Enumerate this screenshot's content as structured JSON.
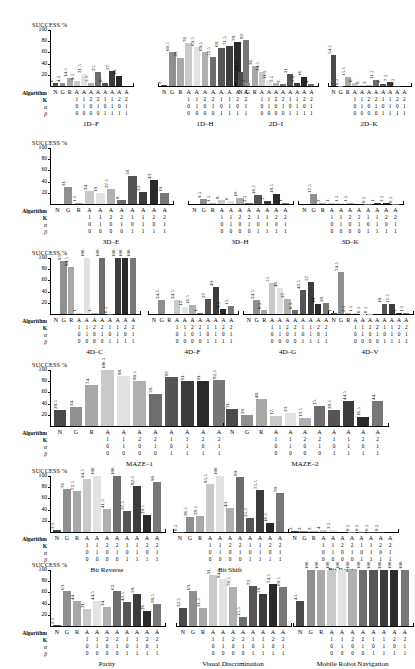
{
  "figure": {
    "y_axis_label": "SUCCESS %",
    "y_ticks": [
      "100",
      "80",
      "60",
      "40",
      "20"
    ],
    "y_max": 100,
    "param_row_labels": {
      "algorithm": "Algorithm",
      "k": "K",
      "alpha": "α",
      "beta": "β"
    },
    "algorithm_labels": [
      "N",
      "G",
      "R",
      "A",
      "A",
      "A",
      "A",
      "A",
      "A",
      "A",
      "A"
    ],
    "k_values": [
      "1",
      "1",
      "2",
      "2",
      "1",
      "1",
      "2",
      "2"
    ],
    "alpha_values": [
      "0",
      "1",
      "0",
      "1",
      "0",
      "1",
      "0",
      "1"
    ],
    "beta_values": [
      "0",
      "0",
      "0",
      "0",
      "1",
      "1",
      "1",
      "1"
    ],
    "bar_colors": [
      "#4a4a4a",
      "#8f8f8f",
      "#a8a8a8",
      "#c9c9c9",
      "#e2e2e2",
      "#b0b0b0",
      "#6e6e6e",
      "#555555",
      "#3c3c3c",
      "#2a2a2a",
      "#777777"
    ]
  },
  "chart_data": [
    {
      "type": "bar",
      "title": "1D–F",
      "ylabel": "SUCCESS %",
      "ylim": [
        0,
        100
      ],
      "categories": [
        "N",
        "G",
        "R",
        "A",
        "A",
        "A",
        "A",
        "A",
        "A",
        "A",
        "A"
      ],
      "values": [
        6,
        4.5,
        14.5,
        9.5,
        21.5,
        5.5,
        25,
        6,
        27,
        18,
        0
      ],
      "labels": [
        "6.",
        "4.5",
        "14.5",
        "9.5",
        "21.5",
        "5.5",
        "25.",
        "6.",
        "27.",
        "18.",
        ""
      ]
    },
    {
      "type": "bar",
      "title": "1D–H",
      "ylabel": "SUCCESS %",
      "ylim": [
        0,
        100
      ],
      "categories": [
        "N",
        "G",
        "R",
        "A",
        "A",
        "A",
        "A",
        "A",
        "A",
        "A",
        "A"
      ],
      "values": [
        2,
        60.5,
        50,
        76,
        69.5,
        60.5,
        52.5,
        68,
        71.5,
        78,
        82
      ],
      "labels": [
        "2.",
        "60.5",
        "50.",
        "76.",
        "69.5",
        "69.5",
        "52.5",
        "68.",
        "71.5",
        "78.",
        "82."
      ]
    },
    {
      "type": "bar",
      "title": "2D–I",
      "ylabel": "SUCCESS %",
      "ylim": [
        0,
        100
      ],
      "categories": [
        "N",
        "G",
        "R",
        "A",
        "A",
        "A",
        "A",
        "A",
        "A",
        "A",
        "A"
      ],
      "values": [
        24.5,
        5,
        36,
        24.5,
        11.5,
        5.5,
        3,
        21,
        5.5,
        16,
        4
      ],
      "labels": [
        "24.5",
        "5.",
        "36.",
        "24.5",
        "11.5",
        "5.5",
        "3.",
        "21.",
        "5.5",
        "16.",
        "4."
      ]
    },
    {
      "type": "bar",
      "title": "2D–K",
      "ylabel": "SUCCESS %",
      "ylim": [
        0,
        100
      ],
      "categories": [
        "N",
        "G",
        "R",
        "A",
        "A",
        "A",
        "A",
        "A",
        "A",
        "A",
        "A"
      ],
      "values": [
        54.5,
        0.5,
        15.5,
        6,
        2,
        2,
        11.5,
        3,
        7.5,
        0.5,
        0
      ],
      "labels": [
        "54.5",
        "0.5",
        "15.5",
        "6.",
        "2.",
        "2.",
        "11.5",
        "3.",
        "7.5",
        "0.5",
        ""
      ]
    },
    {
      "type": "bar",
      "title": "3D–E",
      "ylabel": "SUCCESS %",
      "ylim": [
        0,
        100
      ],
      "categories": [
        "N",
        "G",
        "R",
        "A",
        "A",
        "A",
        "A",
        "A",
        "A",
        "A",
        "A"
      ],
      "values": [
        0,
        31,
        1.5,
        24,
        19,
        27.5,
        8,
        50,
        22,
        43,
        19
      ],
      "labels": [
        "",
        "31.",
        "1.5",
        "24.",
        "19.",
        "27.5",
        "8.",
        "50.",
        "22.",
        "43.",
        "19."
      ]
    },
    {
      "type": "bar",
      "title": "3D–H",
      "ylabel": "SUCCESS %",
      "ylim": [
        0,
        100
      ],
      "categories": [
        "N",
        "G",
        "R",
        "A",
        "A",
        "A",
        "A",
        "A",
        "A",
        "A",
        "A"
      ],
      "values": [
        0,
        9.5,
        1.5,
        8,
        6,
        10,
        2.5,
        16.5,
        5,
        18.5,
        1
      ],
      "labels": [
        "",
        "9.5",
        "1.5",
        "8.",
        "6.",
        "10.",
        "2.5",
        "16.5",
        "5.",
        "18.5",
        "1."
      ]
    },
    {
      "type": "bar",
      "title": "3D–K",
      "ylabel": "SUCCESS %",
      "ylim": [
        0,
        100
      ],
      "categories": [
        "N",
        "G",
        "R",
        "A",
        "A",
        "A",
        "A",
        "A",
        "A",
        "A",
        "A"
      ],
      "values": [
        0,
        17.5,
        2,
        1,
        1.5,
        1.5,
        0,
        0.5,
        1,
        2.5,
        0.5
      ],
      "labels": [
        "",
        "17.5",
        "2.",
        "1.",
        "1.5",
        "1.5",
        "",
        "0.5",
        "1.",
        "2.5",
        "0.5"
      ]
    },
    {
      "type": "bar",
      "title": "4D–C",
      "ylabel": "SUCCESS %",
      "ylim": [
        0,
        100
      ],
      "categories": [
        "N",
        "G",
        "R",
        "A",
        "A",
        "A",
        "A",
        "A",
        "A",
        "A",
        "A"
      ],
      "values": [
        0,
        95,
        84.5,
        1,
        100,
        1,
        100,
        0.5,
        100,
        100,
        100
      ],
      "labels": [
        "",
        "95.",
        "84.5",
        "1.",
        "100.",
        "1.",
        "100.",
        "0.5",
        "100.",
        "100.",
        "100."
      ]
    },
    {
      "type": "bar",
      "title": "4D–F",
      "ylabel": "SUCCESS %",
      "ylim": [
        0,
        100
      ],
      "categories": [
        "N",
        "G",
        "R",
        "A",
        "A",
        "A",
        "A",
        "A",
        "A",
        "A",
        "A"
      ],
      "values": [
        0,
        24.5,
        0,
        24.5,
        12,
        16.5,
        1,
        27,
        49,
        9.5,
        15
      ],
      "labels": [
        "",
        "24.5",
        "",
        "24.5",
        "12.",
        "16.5",
        "1.",
        "27.",
        "49.",
        "9.5",
        "15."
      ]
    },
    {
      "type": "bar",
      "title": "4D–G",
      "ylabel": "SUCCESS %",
      "ylim": [
        0,
        100
      ],
      "categories": [
        "N",
        "G",
        "R",
        "A",
        "A",
        "A",
        "A",
        "A",
        "A",
        "A",
        "A"
      ],
      "values": [
        0,
        24.5,
        6.5,
        55,
        46,
        27,
        6.5,
        42.5,
        57,
        18,
        20
      ],
      "labels": [
        "",
        "24.5",
        "6.5",
        "55.",
        "46.",
        "27.",
        "6.5",
        "42.5",
        "57.",
        "18.",
        "20."
      ]
    },
    {
      "type": "bar",
      "title": "4D–V",
      "ylabel": "SUCCESS %",
      "ylim": [
        0,
        100
      ],
      "categories": [
        "N",
        "G",
        "R",
        "A",
        "A",
        "A",
        "A",
        "A",
        "A",
        "A",
        "A"
      ],
      "values": [
        1,
        74.5,
        2.5,
        1.5,
        0.5,
        0.5,
        0,
        18,
        17.5,
        1,
        1.5
      ],
      "labels": [
        "1.",
        "74.5",
        "2.5",
        "1.5",
        "0.5",
        "0.5",
        "",
        "18.",
        "17.5",
        "1.",
        "1.5"
      ]
    },
    {
      "type": "bar",
      "title": "MAZE–1",
      "ylabel": "SUCCESS %",
      "ylim": [
        0,
        100
      ],
      "categories": [
        "N",
        "G",
        "R",
        "A",
        "A",
        "A",
        "A",
        "A",
        "A",
        "A",
        "A"
      ],
      "values": [
        28.5,
        34,
        74,
        100,
        88.5,
        80.5,
        58,
        87,
        81,
        81,
        82.5
      ],
      "labels": [
        "28.5",
        "34.",
        "74.",
        "100.5",
        "88.",
        "80.5",
        "58.",
        "87.",
        "81.",
        "81.",
        "82.5"
      ]
    },
    {
      "type": "bar",
      "title": "MAZE–2",
      "ylabel": "SUCCESS %",
      "ylim": [
        0,
        100
      ],
      "categories": [
        "N",
        "G",
        "R",
        "A",
        "A",
        "A",
        "A",
        "A",
        "A",
        "A",
        "A"
      ],
      "values": [
        31,
        20,
        48,
        17,
        23,
        13.5,
        35,
        28.5,
        44.5,
        16.5,
        44
      ],
      "labels": [
        "31.",
        "20.",
        "48.",
        "17.",
        "23.",
        "13.5",
        "35.",
        "28.5",
        "44.5",
        "16.5",
        "44."
      ]
    },
    {
      "type": "bar",
      "title": "Bit Reverse",
      "ylabel": "SUCCESS %",
      "ylim": [
        0,
        100
      ],
      "categories": [
        "N",
        "G",
        "R",
        "A",
        "A",
        "A",
        "A",
        "A",
        "A",
        "A",
        "A"
      ],
      "values": [
        3.5,
        76,
        72.5,
        94.5,
        100,
        41.5,
        100,
        37.5,
        82.5,
        29.5,
        90
      ],
      "labels": [
        "3.5",
        "76.",
        "72.5",
        "94.5",
        "100.",
        "41.5",
        "100.",
        "37.5",
        "82.5",
        "29.5",
        "90."
      ]
    },
    {
      "type": "bar",
      "title": "Bit Shift",
      "ylabel": "SUCCESS %",
      "ylim": [
        0,
        100
      ],
      "categories": [
        "N",
        "G",
        "R",
        "A",
        "A",
        "A",
        "A",
        "A",
        "A",
        "A",
        "A"
      ],
      "values": [
        0.5,
        26.5,
        28.5,
        85.5,
        100,
        43,
        99,
        25.5,
        75.5,
        16.5,
        70
      ],
      "labels": [
        "0.5",
        "26.5",
        "28.5",
        "85.5",
        "100.",
        "43.",
        "99.",
        "25.5",
        "75.5",
        "16.5",
        "70."
      ]
    },
    {
      "type": "bar",
      "title": "Bit Rotate",
      "ylabel": "SUCCESS %",
      "ylim": [
        0,
        100
      ],
      "categories": [
        "N",
        "G",
        "R",
        "A",
        "A",
        "A",
        "A",
        "A",
        "A",
        "A",
        "A"
      ],
      "values": [
        2,
        2,
        2,
        4,
        3.5,
        0,
        0.5,
        0.5,
        0.5,
        0.5,
        0
      ],
      "labels": [
        "2.",
        "2.",
        "2.",
        "4.",
        "3.5",
        "",
        "0.5",
        "0.5",
        "0.5",
        "0.5",
        ""
      ]
    },
    {
      "type": "bar",
      "title": "Parity",
      "ylabel": "SUCCESS %",
      "ylim": [
        0,
        100
      ],
      "categories": [
        "N",
        "G",
        "R",
        "A",
        "A",
        "A",
        "A",
        "A",
        "A",
        "A",
        "A"
      ],
      "values": [
        2.5,
        63,
        44,
        31,
        44.5,
        34,
        62,
        42.5,
        58,
        26,
        38.5
      ],
      "labels": [
        "2.5",
        "63.",
        "44.",
        "31.",
        "44.5",
        "34.",
        "62.",
        "42.5",
        "58.",
        "26.",
        "38.5"
      ]
    },
    {
      "type": "bar",
      "title": "Visual Discrimination",
      "ylabel": "SUCCESS %",
      "ylim": [
        0,
        100
      ],
      "categories": [
        "N",
        "G",
        "R",
        "A",
        "A",
        "A",
        "A",
        "A",
        "A",
        "A",
        "A"
      ],
      "values": [
        32.5,
        63,
        31.5,
        91,
        84.5,
        70.5,
        15.5,
        72,
        58,
        74.5,
        69.5
      ],
      "labels": [
        "32.5",
        "63.",
        "31.5",
        "91.",
        "84.5",
        "70.5",
        "15.5",
        "72.",
        "58.",
        "74.5",
        "69.5"
      ]
    },
    {
      "type": "bar",
      "title": "Mobile Robot Navigation",
      "ylabel": "SUCCESS %",
      "ylim": [
        0,
        100
      ],
      "categories": [
        "N",
        "G",
        "R",
        "A",
        "A",
        "A",
        "A",
        "A",
        "A",
        "A",
        "A"
      ],
      "values": [
        45,
        100,
        100,
        100,
        100,
        100,
        100,
        100,
        100,
        100,
        100
      ],
      "labels": [
        "45.",
        "100.",
        "100.",
        "100.",
        "100.",
        "100.",
        "100.",
        "100.",
        "100.",
        "100.",
        "100."
      ]
    }
  ],
  "rows": [
    {
      "panels": [
        0,
        1,
        2,
        3
      ]
    },
    {
      "panels": [
        4,
        5,
        6
      ]
    },
    {
      "panels": [
        7,
        8,
        9,
        10
      ]
    },
    {
      "panels": [
        11,
        12
      ]
    },
    {
      "panels": [
        13,
        14,
        15
      ]
    },
    {
      "panels": [
        16,
        17,
        18
      ]
    }
  ]
}
